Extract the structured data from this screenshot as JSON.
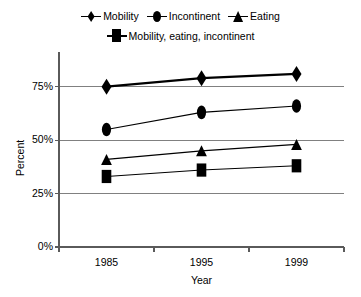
{
  "chart_data": {
    "type": "line",
    "title": "",
    "xlabel": "Year",
    "ylabel": "Percent",
    "categories": [
      "1985",
      "1995",
      "1999"
    ],
    "ylim": [
      0,
      87.5
    ],
    "yticks": [
      0,
      25,
      50,
      75
    ],
    "ytick_labels": [
      "0%",
      "25%",
      "50%",
      "75%"
    ],
    "grid": "horizontal",
    "legend_position": "top-center",
    "series": [
      {
        "name": "Mobility",
        "marker": "diamond",
        "values": [
          75,
          79,
          81
        ]
      },
      {
        "name": "Incontinent",
        "marker": "circle",
        "values": [
          55,
          63,
          66
        ]
      },
      {
        "name": "Eating",
        "marker": "triangle",
        "values": [
          41,
          45,
          48
        ]
      },
      {
        "name": "Mobility, eating, incontinent",
        "marker": "square",
        "values": [
          33,
          36,
          38
        ]
      }
    ]
  },
  "legend": {
    "row1": [
      {
        "label": "Mobility",
        "marker": "diamond"
      },
      {
        "label": "Incontinent",
        "marker": "circle"
      },
      {
        "label": "Eating",
        "marker": "triangle"
      }
    ],
    "row2": [
      {
        "label": "Mobility, eating, incontinent",
        "marker": "square"
      }
    ]
  },
  "axes": {
    "y_title": "Percent",
    "x_title": "Year",
    "y_tick_labels": [
      "75%",
      "50%",
      "25%",
      "0%"
    ],
    "x_tick_labels": [
      "1985",
      "1995",
      "1999"
    ]
  },
  "colors": {
    "line": "#000000",
    "marker": "#000000",
    "grid": "#808080",
    "axis": "#5a5a5a",
    "background": "#ffffff"
  }
}
